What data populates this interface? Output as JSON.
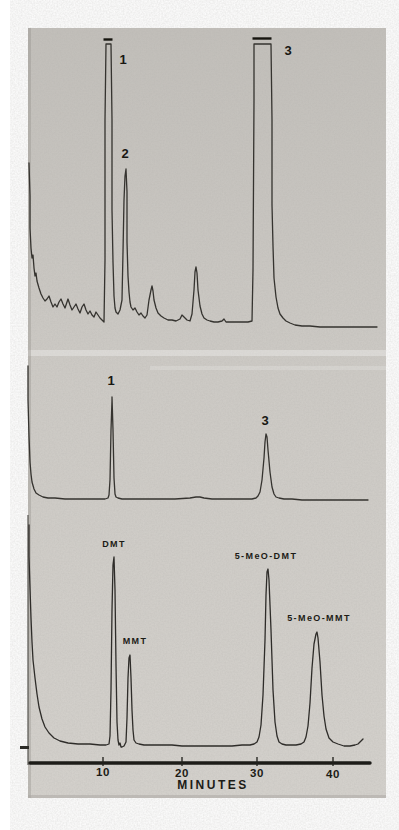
{
  "figure": {
    "description_labels": {
      "x_axis_title": "MINUTES"
    }
  },
  "chart_data": {
    "type": "line",
    "title": "",
    "xlabel": "MINUTES",
    "ylabel": "",
    "x_ticks": [
      "10",
      "20",
      "30",
      "40"
    ],
    "x_range_minutes": [
      0,
      46
    ],
    "grid": false,
    "legend": "none",
    "panels": [
      {
        "name": "top-chromatogram",
        "peaks": [
          {
            "label": "1",
            "rt_min": 10.3,
            "height_rel": 1.0,
            "clipped": true
          },
          {
            "label": "2",
            "rt_min": 12.9,
            "height_rel": 0.54,
            "clipped": false
          },
          {
            "label": "",
            "rt_min": 16.3,
            "height_rel": 0.13,
            "clipped": false
          },
          {
            "label": "",
            "rt_min": 22.1,
            "height_rel": 0.19,
            "clipped": false
          },
          {
            "label": "3",
            "rt_min": 30.8,
            "height_rel": 1.0,
            "clipped": true
          }
        ]
      },
      {
        "name": "middle-chromatogram",
        "peaks": [
          {
            "label": "1",
            "rt_min": 11.1,
            "height_rel": 0.74,
            "clipped": false
          },
          {
            "label": "3",
            "rt_min": 31.2,
            "height_rel": 0.47,
            "clipped": false
          }
        ]
      },
      {
        "name": "bottom-chromatogram",
        "peaks": [
          {
            "label": "DMT",
            "rt_min": 11.4,
            "height_rel": 0.84,
            "clipped": false
          },
          {
            "label": "MMT",
            "rt_min": 13.5,
            "height_rel": 0.4,
            "clipped": false
          },
          {
            "label": "5-MeO-DMT",
            "rt_min": 31.5,
            "height_rel": 0.79,
            "clipped": false
          },
          {
            "label": "5-MeO-MMT",
            "rt_min": 37.9,
            "height_rel": 0.51,
            "clipped": false
          }
        ]
      }
    ],
    "labels": {
      "top_1": {
        "text": "1",
        "x": 123,
        "y": 64
      },
      "top_2": {
        "text": "2",
        "x": 125,
        "y": 158
      },
      "top_3": {
        "text": "3",
        "x": 288,
        "y": 55
      },
      "mid_1": {
        "text": "1",
        "x": 111,
        "y": 385
      },
      "mid_3": {
        "text": "3",
        "x": 265,
        "y": 425
      },
      "bot_dmt": {
        "text": "DMT",
        "x": 114,
        "y": 547
      },
      "bot_mmt": {
        "text": "MMT",
        "x": 135,
        "y": 644
      },
      "bot_5meo_dmt": {
        "text": "5-MeO-DMT",
        "x": 266,
        "y": 559
      },
      "bot_5meo_mmt": {
        "text": "5-MeO-MMT",
        "x": 319,
        "y": 621
      },
      "tick_10": {
        "text": "10",
        "x": 103,
        "y": 776
      },
      "tick_20": {
        "text": "20",
        "x": 182,
        "y": 777
      },
      "tick_30": {
        "text": "30",
        "x": 257,
        "y": 777
      },
      "tick_40": {
        "text": "40",
        "x": 333,
        "y": 778
      },
      "axis_title": {
        "text": "MINUTES",
        "x": 213,
        "y": 789
      }
    },
    "clip_bars": [
      {
        "x1": 103.5,
        "x2": 112.5,
        "y": 39.5
      },
      {
        "x1": 252.5,
        "x2": 271.5,
        "y": 38.5
      }
    ],
    "axis": {
      "line": {
        "x1": 30,
        "x2": 370,
        "y": 763
      },
      "tick_xs": [
        103,
        182,
        257,
        333
      ],
      "tick_y1": 757,
      "tick_y2": 766
    },
    "colors": {
      "photo_gray": "#cfccc7",
      "trace_ink": "#35332f",
      "label_ink": "#1c1b16"
    },
    "traces_px": {
      "top": [
        [
          29,
          163
        ],
        [
          30,
          196
        ],
        [
          30,
          228
        ],
        [
          31,
          248
        ],
        [
          32,
          258
        ],
        [
          33,
          255
        ],
        [
          34,
          268
        ],
        [
          35,
          276
        ],
        [
          36,
          273
        ],
        [
          37,
          281
        ],
        [
          39,
          288
        ],
        [
          41,
          294
        ],
        [
          43,
          298
        ],
        [
          45,
          301
        ],
        [
          47,
          299
        ],
        [
          49,
          296
        ],
        [
          51,
          302
        ],
        [
          53,
          307
        ],
        [
          55,
          304
        ],
        [
          57,
          307
        ],
        [
          59,
          302
        ],
        [
          61,
          299
        ],
        [
          63,
          304
        ],
        [
          65,
          308
        ],
        [
          67,
          302
        ],
        [
          68,
          299
        ],
        [
          70,
          305
        ],
        [
          72,
          310
        ],
        [
          74,
          307
        ],
        [
          76,
          304
        ],
        [
          78,
          309
        ],
        [
          80,
          313
        ],
        [
          82,
          307
        ],
        [
          84,
          304
        ],
        [
          86,
          310
        ],
        [
          88,
          314
        ],
        [
          90,
          311
        ],
        [
          92,
          315
        ],
        [
          94,
          317
        ],
        [
          96,
          312
        ],
        [
          98,
          315
        ],
        [
          100,
          318
        ],
        [
          102,
          320
        ],
        [
          104,
          322
        ],
        [
          105,
          260
        ],
        [
          105,
          120
        ],
        [
          106,
          44
        ],
        [
          111,
          44
        ],
        [
          112,
          120
        ],
        [
          112,
          210
        ],
        [
          113,
          262
        ],
        [
          114,
          296
        ],
        [
          115,
          308
        ],
        [
          116,
          312
        ],
        [
          118,
          314
        ],
        [
          120,
          310
        ],
        [
          122,
          300
        ],
        [
          123,
          252
        ],
        [
          124,
          200
        ],
        [
          125,
          176
        ],
        [
          126,
          169
        ],
        [
          127,
          192
        ],
        [
          127,
          242
        ],
        [
          128,
          276
        ],
        [
          129,
          292
        ],
        [
          130,
          302
        ],
        [
          131,
          307
        ],
        [
          133,
          310
        ],
        [
          135,
          308
        ],
        [
          137,
          312
        ],
        [
          139,
          315
        ],
        [
          141,
          313
        ],
        [
          143,
          316
        ],
        [
          145,
          318
        ],
        [
          147,
          315
        ],
        [
          149,
          300
        ],
        [
          151,
          290
        ],
        [
          152,
          286
        ],
        [
          153,
          291
        ],
        [
          154,
          300
        ],
        [
          156,
          308
        ],
        [
          158,
          313
        ],
        [
          161,
          316
        ],
        [
          164,
          318
        ],
        [
          168,
          320
        ],
        [
          172,
          320
        ],
        [
          176,
          321
        ],
        [
          180,
          319
        ],
        [
          182,
          315
        ],
        [
          184,
          317
        ],
        [
          187,
          320
        ],
        [
          190,
          321
        ],
        [
          192,
          314
        ],
        [
          194,
          290
        ],
        [
          195,
          272
        ],
        [
          196,
          267
        ],
        [
          197,
          273
        ],
        [
          198,
          290
        ],
        [
          200,
          306
        ],
        [
          202,
          314
        ],
        [
          204,
          318
        ],
        [
          207,
          320
        ],
        [
          210,
          321
        ],
        [
          214,
          322
        ],
        [
          218,
          322
        ],
        [
          222,
          321
        ],
        [
          224,
          319
        ],
        [
          226,
          322
        ],
        [
          230,
          322
        ],
        [
          236,
          322
        ],
        [
          242,
          322
        ],
        [
          248,
          322
        ],
        [
          252,
          321
        ],
        [
          253,
          270
        ],
        [
          254,
          100
        ],
        [
          254,
          44
        ],
        [
          271,
          44
        ],
        [
          272,
          120
        ],
        [
          272,
          205
        ],
        [
          273,
          246
        ],
        [
          274,
          278
        ],
        [
          276,
          297
        ],
        [
          278,
          308
        ],
        [
          280,
          314
        ],
        [
          283,
          318
        ],
        [
          286,
          321
        ],
        [
          290,
          323
        ],
        [
          295,
          325
        ],
        [
          302,
          326
        ],
        [
          310,
          326
        ],
        [
          320,
          327
        ],
        [
          332,
          327
        ],
        [
          345,
          327
        ],
        [
          358,
          327
        ],
        [
          370,
          327
        ],
        [
          377,
          327
        ]
      ],
      "middle": [
        [
          28,
          366
        ],
        [
          28,
          400
        ],
        [
          29,
          436
        ],
        [
          30,
          462
        ],
        [
          31,
          474
        ],
        [
          32,
          482
        ],
        [
          34,
          489
        ],
        [
          36,
          493
        ],
        [
          39,
          495
        ],
        [
          43,
          497
        ],
        [
          48,
          498
        ],
        [
          55,
          498
        ],
        [
          65,
          499
        ],
        [
          80,
          499
        ],
        [
          95,
          499
        ],
        [
          105,
          499
        ],
        [
          108,
          498
        ],
        [
          109,
          495
        ],
        [
          110,
          480
        ],
        [
          111,
          430
        ],
        [
          112,
          400
        ],
        [
          112,
          397
        ],
        [
          113,
          430
        ],
        [
          114,
          478
        ],
        [
          115,
          494
        ],
        [
          116,
          497
        ],
        [
          118,
          498
        ],
        [
          122,
          499
        ],
        [
          130,
          499
        ],
        [
          145,
          499
        ],
        [
          160,
          499
        ],
        [
          175,
          499
        ],
        [
          190,
          498
        ],
        [
          196,
          497
        ],
        [
          200,
          497
        ],
        [
          204,
          498
        ],
        [
          212,
          499
        ],
        [
          225,
          499
        ],
        [
          240,
          499
        ],
        [
          252,
          499
        ],
        [
          256,
          498
        ],
        [
          258,
          496
        ],
        [
          260,
          492
        ],
        [
          262,
          480
        ],
        [
          264,
          458
        ],
        [
          265,
          442
        ],
        [
          266,
          434
        ],
        [
          267,
          437
        ],
        [
          268,
          450
        ],
        [
          270,
          472
        ],
        [
          272,
          487
        ],
        [
          274,
          494
        ],
        [
          276,
          497
        ],
        [
          279,
          498
        ],
        [
          284,
          499
        ],
        [
          292,
          499
        ],
        [
          302,
          500
        ],
        [
          315,
          500
        ],
        [
          330,
          500
        ],
        [
          345,
          500
        ],
        [
          358,
          500
        ],
        [
          368,
          500
        ]
      ],
      "bottom": [
        [
          29,
          525
        ],
        [
          29,
          556
        ],
        [
          30,
          588
        ],
        [
          31,
          618
        ],
        [
          32,
          642
        ],
        [
          33,
          660
        ],
        [
          35,
          678
        ],
        [
          37,
          694
        ],
        [
          39,
          707
        ],
        [
          42,
          719
        ],
        [
          45,
          727
        ],
        [
          49,
          733
        ],
        [
          54,
          738
        ],
        [
          60,
          741
        ],
        [
          68,
          743
        ],
        [
          78,
          744
        ],
        [
          90,
          744
        ],
        [
          100,
          745
        ],
        [
          106,
          745
        ],
        [
          109,
          744
        ],
        [
          110,
          736
        ],
        [
          111,
          690
        ],
        [
          112,
          610
        ],
        [
          113,
          565
        ],
        [
          114,
          557
        ],
        [
          115,
          590
        ],
        [
          116,
          665
        ],
        [
          117,
          722
        ],
        [
          118,
          740
        ],
        [
          119,
          745
        ],
        [
          120,
          743
        ],
        [
          121,
          747
        ],
        [
          122,
          747
        ],
        [
          124,
          746
        ],
        [
          126,
          742
        ],
        [
          127,
          718
        ],
        [
          128,
          678
        ],
        [
          129,
          658
        ],
        [
          130,
          655
        ],
        [
          131,
          678
        ],
        [
          132,
          710
        ],
        [
          133,
          730
        ],
        [
          134,
          740
        ],
        [
          136,
          743
        ],
        [
          139,
          744
        ],
        [
          144,
          745
        ],
        [
          152,
          745
        ],
        [
          162,
          745
        ],
        [
          172,
          745
        ],
        [
          182,
          746
        ],
        [
          192,
          746
        ],
        [
          202,
          746
        ],
        [
          212,
          746
        ],
        [
          222,
          746
        ],
        [
          232,
          746
        ],
        [
          242,
          745
        ],
        [
          250,
          745
        ],
        [
          254,
          744
        ],
        [
          257,
          742
        ],
        [
          259,
          737
        ],
        [
          261,
          725
        ],
        [
          263,
          695
        ],
        [
          265,
          640
        ],
        [
          266,
          595
        ],
        [
          267,
          572
        ],
        [
          268,
          569
        ],
        [
          269,
          580
        ],
        [
          271,
          630
        ],
        [
          273,
          690
        ],
        [
          275,
          722
        ],
        [
          277,
          736
        ],
        [
          279,
          742
        ],
        [
          282,
          744
        ],
        [
          286,
          745
        ],
        [
          291,
          745
        ],
        [
          296,
          745
        ],
        [
          301,
          744
        ],
        [
          304,
          742
        ],
        [
          306,
          737
        ],
        [
          308,
          726
        ],
        [
          310,
          703
        ],
        [
          312,
          668
        ],
        [
          314,
          644
        ],
        [
          316,
          634
        ],
        [
          317,
          632
        ],
        [
          318,
          638
        ],
        [
          320,
          662
        ],
        [
          322,
          695
        ],
        [
          324,
          716
        ],
        [
          326,
          729
        ],
        [
          329,
          738
        ],
        [
          333,
          742
        ],
        [
          338,
          744
        ],
        [
          344,
          746
        ],
        [
          350,
          746
        ],
        [
          355,
          745
        ],
        [
          358,
          744
        ],
        [
          361,
          741
        ],
        [
          363,
          739
        ]
      ]
    }
  }
}
